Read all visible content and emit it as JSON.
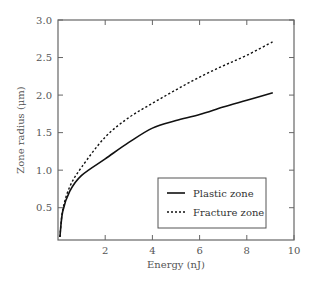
{
  "chart_data": {
    "type": "line",
    "title": "",
    "xlabel": "Energy (nJ)",
    "ylabel": "Zone radius (μm)",
    "xlim": [
      0,
      10
    ],
    "ylim": [
      0.07,
      3.0
    ],
    "xticks": [
      2,
      4,
      6,
      8,
      10
    ],
    "xtick_labels": [
      "2",
      "4",
      "6",
      "8",
      "10"
    ],
    "yticks": [
      0.5,
      1.0,
      1.5,
      2.0,
      2.5,
      3.0
    ],
    "ytick_labels": [
      "0.5",
      "1.0",
      "1.5",
      "2.0",
      "2.5",
      "3.0"
    ],
    "grid": false,
    "legend_position": "lower right (inside)",
    "series": [
      {
        "name": "Plastic zone",
        "style": "solid",
        "color": "#111111",
        "x": [
          0.08,
          0.2,
          0.5,
          1.0,
          2.0,
          3.0,
          4.0,
          5.0,
          6.0,
          7.0,
          8.0,
          9.1
        ],
        "y": [
          0.11,
          0.45,
          0.72,
          0.93,
          1.15,
          1.37,
          1.56,
          1.66,
          1.74,
          1.84,
          1.93,
          2.03
        ]
      },
      {
        "name": "Fracture zone",
        "style": "dashed",
        "color": "#111111",
        "x": [
          0.08,
          0.2,
          0.5,
          1.0,
          2.0,
          3.0,
          4.0,
          5.0,
          6.0,
          7.0,
          8.0,
          9.1
        ],
        "y": [
          0.11,
          0.47,
          0.78,
          1.04,
          1.44,
          1.7,
          1.89,
          2.07,
          2.24,
          2.39,
          2.53,
          2.71
        ]
      }
    ]
  },
  "legend": {
    "items": [
      {
        "label": "Plastic zone",
        "style": "solid"
      },
      {
        "label": "Fracture zone",
        "style": "dashed"
      }
    ]
  }
}
